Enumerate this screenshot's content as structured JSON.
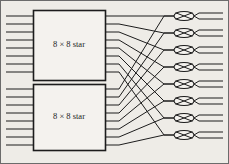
{
  "figure": {
    "background_color": "#eeece7",
    "line_color": "#1c1c1c",
    "box_fill": "#f4f2ee",
    "border_color": "#6b6b6b"
  },
  "stages": {
    "first_stage": {
      "module_count": 2,
      "modules": [
        {
          "id": "star-module-top",
          "label": "8 × 8 star",
          "x": 33,
          "y": 10,
          "width": 72,
          "height": 70,
          "input_count": 8,
          "output_count": 8
        },
        {
          "id": "star-module-bottom",
          "label": "8 × 8 star",
          "x": 33,
          "y": 84,
          "width": 72,
          "height": 66,
          "input_count": 8,
          "output_count": 8
        }
      ]
    },
    "second_stage": {
      "switch_count": 8,
      "switch_label": "2 × 2 switch",
      "switch_glyph": "crossed-oval",
      "switch_width": 20,
      "switch_height": 9,
      "switch_x": 174,
      "switches_y": [
        16,
        33,
        50,
        67,
        84,
        101,
        118,
        135
      ]
    }
  },
  "inputs": {
    "count": 16,
    "x_start": 6,
    "x_end": 33,
    "top_module_y": [
      16,
      24,
      32,
      40,
      48,
      56,
      64,
      72
    ],
    "bottom_module_y": [
      89,
      97,
      105,
      113,
      121,
      129,
      137,
      145
    ]
  },
  "outputs": {
    "count": 16,
    "x_start": 194,
    "x_end": 223,
    "y": [
      13,
      19,
      30,
      36,
      47,
      53,
      64,
      70,
      81,
      87,
      98,
      104,
      115,
      121,
      132,
      138
    ]
  },
  "interconnect": {
    "description": "Each 2x2 switch receives one line from the top star module and one from the bottom star module",
    "top_links": [
      {
        "from_y": 16,
        "to_y": 16
      },
      {
        "from_y": 24,
        "to_y": 33
      },
      {
        "from_y": 32,
        "to_y": 50
      },
      {
        "from_y": 40,
        "to_y": 67
      },
      {
        "from_y": 48,
        "to_y": 84
      },
      {
        "from_y": 56,
        "to_y": 101
      },
      {
        "from_y": 64,
        "to_y": 118
      },
      {
        "from_y": 72,
        "to_y": 135
      }
    ],
    "bottom_links": [
      {
        "from_y": 89,
        "to_y": 16
      },
      {
        "from_y": 97,
        "to_y": 33
      },
      {
        "from_y": 105,
        "to_y": 50
      },
      {
        "from_y": 113,
        "to_y": 67
      },
      {
        "from_y": 121,
        "to_y": 84
      },
      {
        "from_y": 129,
        "to_y": 101
      },
      {
        "from_y": 137,
        "to_y": 118
      },
      {
        "from_y": 145,
        "to_y": 135
      }
    ]
  }
}
